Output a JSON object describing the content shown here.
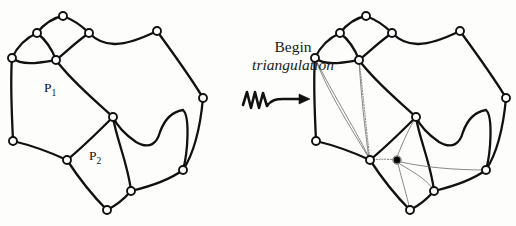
{
  "figure": {
    "background_color": "#fdfdfb",
    "stroke_color": "#111111",
    "thin_stroke_color": "#5a5a5a",
    "vertex_fill": "#ffffff",
    "center_vertex_fill": "#000000",
    "width": 516,
    "height": 226
  },
  "caption": {
    "line1": "Begin",
    "line2": "triangulation",
    "arrow_icon": "squiggly-arrow-right-icon"
  },
  "left_panel": {
    "name": "original-planar-graph",
    "face_labels": [
      {
        "id": "P1",
        "text": "P",
        "subscript": "1",
        "x": 44,
        "y": 80
      },
      {
        "id": "P2",
        "text": "P",
        "subscript": "2",
        "x": 89,
        "y": 148
      }
    ],
    "vertices": [
      {
        "id": "v-top",
        "x": 63,
        "y": 16
      },
      {
        "id": "v-upper-left",
        "x": 37,
        "y": 33
      },
      {
        "id": "v-left",
        "x": 12,
        "y": 58
      },
      {
        "id": "v-mid-upper",
        "x": 56,
        "y": 60
      },
      {
        "id": "v-upper-right",
        "x": 89,
        "y": 33
      },
      {
        "id": "v-spike-top",
        "x": 157,
        "y": 31
      },
      {
        "id": "v-right",
        "x": 203,
        "y": 98
      },
      {
        "id": "v-center",
        "x": 113,
        "y": 117
      },
      {
        "id": "v-lower-left",
        "x": 13,
        "y": 141
      },
      {
        "id": "v-p2-left",
        "x": 67,
        "y": 160
      },
      {
        "id": "v-p2-bottom",
        "x": 107,
        "y": 210
      },
      {
        "id": "v-p2-right",
        "x": 131,
        "y": 191
      },
      {
        "id": "v-lower-right",
        "x": 183,
        "y": 170
      }
    ],
    "edges": [
      "v-top -> v-upper-left",
      "v-top -> v-upper-right",
      "v-upper-left -> v-left",
      "v-upper-left -> v-mid-upper",
      "v-left -> v-mid-upper",
      "v-mid-upper -> v-upper-right",
      "v-upper-right -> v-spike-top",
      "v-spike-top -> v-right",
      "v-left -> v-lower-left",
      "v-mid-upper -> v-center",
      "v-lower-left -> v-p2-left",
      "v-p2-left -> v-center",
      "v-p2-left -> v-p2-bottom",
      "v-p2-bottom -> v-p2-right",
      "v-p2-right -> v-center",
      "v-p2-right -> v-lower-right",
      "v-lower-right -> v-center",
      "v-lower-right -> v-right"
    ],
    "vertex_count": 13
  },
  "right_panel": {
    "name": "triangulated-planar-graph",
    "x_offset": 303,
    "center_vertex": {
      "id": "v-p2-center-dot",
      "x": 397,
      "y": 160,
      "style": "filled"
    },
    "added_chords_p1": [
      "v-left -> v-p2-left (thin)",
      "v-left -> v-lower-left-interior (thin)",
      "v-mid-upper -> v-p2-left (dotted)",
      "v-mid-upper -> v-lower-left (thin)"
    ],
    "added_spokes_p2": [
      "center -> v-p2-left",
      "center -> v-center",
      "center -> v-lower-right",
      "center -> v-p2-bottom",
      "center -> v-p2-right"
    ],
    "vertex_count": 13
  }
}
